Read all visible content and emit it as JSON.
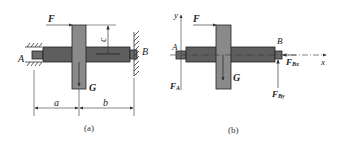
{
  "figure_a": {
    "caption": "(a)",
    "labels": {
      "force": "F",
      "support_left": "A",
      "support_right": "B",
      "weight": "G",
      "dim_c": "c",
      "dim_a": "a",
      "dim_b": "b"
    }
  },
  "figure_b": {
    "caption": "(b)",
    "labels": {
      "force": "F",
      "point_a": "A",
      "point_b": "B",
      "weight": "G",
      "axis_x": "x",
      "axis_y": "y",
      "reaction_a": "F",
      "reaction_a_sub": "A",
      "reaction_bx": "F",
      "reaction_bx_sub": "Bx",
      "reaction_by": "F",
      "reaction_by_sub": "By"
    }
  },
  "colors": {
    "gear_fill": "#8a8a8a",
    "shaft_fill": "#5e5e5e",
    "line": "#333333"
  }
}
